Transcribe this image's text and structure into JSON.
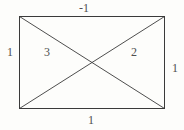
{
  "diagram": {
    "background_color": "#fdfdfb",
    "stroke_color": "#3a3a3a",
    "text_color": "#4f4f4f",
    "shape": {
      "type": "rectangle",
      "x": 19,
      "y": 16,
      "width": 145,
      "height": 92,
      "diagonals": [
        {
          "name": "top-left-to-bottom-right",
          "x1": 19,
          "y1": 16,
          "x2": 164,
          "y2": 108
        },
        {
          "name": "bottom-left-to-top-right",
          "x1": 19,
          "y1": 108,
          "x2": 164,
          "y2": 16
        }
      ],
      "intersection": {
        "x": 91.5,
        "y": 62
      }
    },
    "edge_labels": {
      "top": "-1",
      "left": "1",
      "right": "1",
      "bottom": "1"
    },
    "region_labels": {
      "left_triangle": "3",
      "right_triangle": "2"
    },
    "label_positions": {
      "top": {
        "x": 84,
        "y": 8
      },
      "left": {
        "x": 10,
        "y": 52
      },
      "right": {
        "x": 175,
        "y": 68
      },
      "bottom": {
        "x": 91,
        "y": 120
      },
      "left_triangle": {
        "x": 47,
        "y": 52
      },
      "right_triangle": {
        "x": 134,
        "y": 52
      }
    }
  }
}
